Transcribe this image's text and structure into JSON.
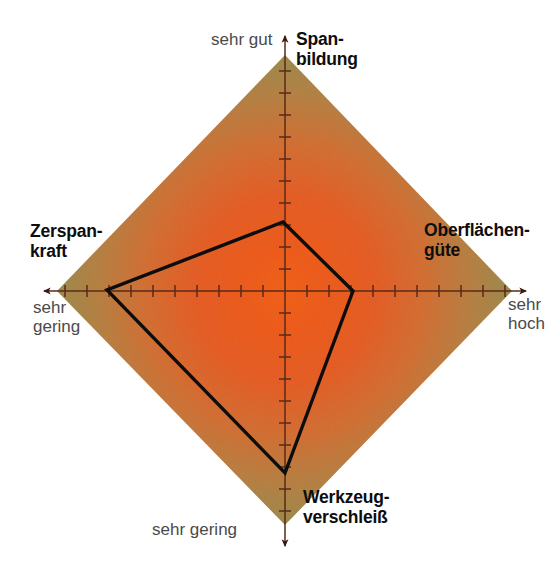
{
  "figure": {
    "caption": "",
    "background_color": "#ffffff",
    "width": 556,
    "height": 575
  },
  "axes_titles": {
    "top": "Span-\nbildung",
    "right": "Oberflächen-\ngüte",
    "bottom": "Werkzeug-\nverschleiß",
    "left": "Zerspan-\nkraft"
  },
  "scale_labels": {
    "top": "sehr gut",
    "right": "sehr\nhoch",
    "bottom": "sehr gering",
    "left": "sehr\ngering"
  },
  "colors": {
    "center": "#e8501a",
    "mid": "#c9763a",
    "edge": "#7d9453",
    "outline": "#0d0d0d",
    "axis": "#5a2a18",
    "title_text": "#0d0d0d",
    "scale_text": "#4a4a4a"
  },
  "chart_data": {
    "type": "radar",
    "title": "",
    "subtitle": "",
    "xlabel": "",
    "ylabel": "",
    "grid": false,
    "legend": "none",
    "center_px": [
      285,
      291
    ],
    "axis_length_px": 228,
    "tick_count_per_axis": 10,
    "tick_spacing_px": 22,
    "scale_min": 0,
    "scale_max": 10,
    "categories": [
      "Spanbildung",
      "Oberflächengüte",
      "Werkzeugverschleiß",
      "Zerspankraft"
    ],
    "axis_directions": [
      "up",
      "right",
      "down",
      "left"
    ],
    "axis_scale_poles": {
      "Spanbildung": "sehr gut",
      "Oberflächengüte": "sehr hoch",
      "Werkzeugverschleiß": "sehr gering",
      "Zerspankraft": "sehr gering"
    },
    "series": [
      {
        "name": "Bewertung",
        "values": [
          3.1,
          3.1,
          8.3,
          8.1
        ],
        "vertices_px": [
          [
            283,
            222
          ],
          [
            353,
            291
          ],
          [
            285,
            473
          ],
          [
            107,
            290
          ]
        ],
        "line_color": "#0d0d0d",
        "line_width": 3.4,
        "fill": "none"
      }
    ],
    "background_field": {
      "shape": "diamond",
      "corners_px": [
        [
          285,
          55
        ],
        [
          512,
          291
        ],
        [
          285,
          525
        ],
        [
          57,
          291
        ]
      ],
      "gradient": "radial",
      "gradient_stops": [
        {
          "offset": 0.0,
          "color": "#ef5a15"
        },
        {
          "offset": 0.28,
          "color": "#e8591c"
        },
        {
          "offset": 0.55,
          "color": "#ca7536"
        },
        {
          "offset": 0.78,
          "color": "#9d8a49"
        },
        {
          "offset": 1.0,
          "color": "#7d9453"
        }
      ]
    }
  }
}
